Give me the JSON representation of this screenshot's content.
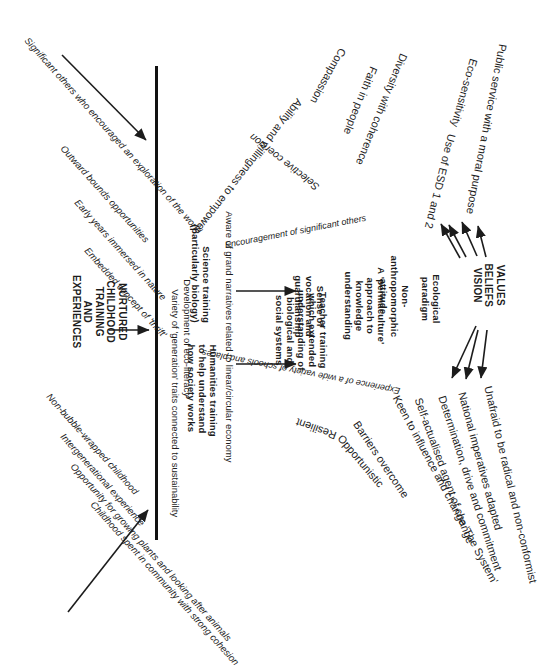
{
  "diagram": {
    "orientation": "rotated-90-clockwise",
    "ink_color": "#1c1c1c",
    "spine_color": "#111111"
  },
  "hub": {
    "line1": "VALUES",
    "line2": "BELIEFS",
    "line3": "VISION"
  },
  "root_block": {
    "line1": "NURTURED",
    "line2": "CHILDHOOD",
    "line3": "TRAINING",
    "line4": "AND",
    "line5": "EXPERIENCES"
  },
  "early_experiences": [
    "Significant others who encouraged an exploration of the world",
    "Outward bounds opportunities",
    "Early years immersed in nature",
    "Embedded concept of 'thrift'"
  ],
  "childhood_experiences": [
    "Non-bubble-wrapped childhood",
    "Intergenerational experience",
    "Opportunity for growing plants and looking after animals",
    "Childhood spent in community with strong cohesion"
  ],
  "training_column": [
    "Aware of grand narratives related to linear/circular economy",
    "Science training (particularly biology)",
    "Humanities training to help understand how society works",
    "Development of eco-literacy",
    "Variety of 'generation' traits connected to sustainability"
  ],
  "training_column_parts": {
    "grand_narratives": "Aware of grand narratives related to linear/circular economy",
    "science_l1": "Science training",
    "science_l2": "(particularly biology)",
    "humanities_l1": "Humanities training",
    "humanities_l2": "to help understand",
    "humanities_l3": "how society works",
    "eco_literacy": "Development of eco-literacy",
    "generation_traits": "Variety of 'generation' traits connected to sustainability"
  },
  "mid_column": {
    "teacher_training_l1": "Teacher training",
    "teacher_training_l2": "which extended",
    "teacher_training_l3": "understanding of",
    "teacher_training_l4": "biological and",
    "teacher_training_l5": "social systems",
    "vocation_l1": "Sense of",
    "vocation_l2": "vocation and",
    "vocation_l3": "guardianship",
    "permaculture_l1": "A 'permaculture'",
    "permaculture_l2": "approach to",
    "permaculture_l3": "knowledge",
    "permaculture_l4": "understanding",
    "non_anthro_l1": "Non-",
    "non_anthro_l2": "anthropomorphic",
    "non_anthro_l3": "attitude",
    "ecological_l1": "Ecological",
    "ecological_l2": "paradigm"
  },
  "influences": {
    "encouragement": "Encouragement of significant others",
    "experience_schools": "Experience of a wide variety of schools and places",
    "selective_coercion": "Selective coercion"
  },
  "values_fan": [
    "Public service with a moral purpose",
    "Eco-sensitivity",
    "Use of ESD 1 and 2",
    "Diversity with coherence",
    "Faith in people",
    "Compassion",
    "Ability and willingness to empower"
  ],
  "action_fan": [
    "Unafraid to be radical and non-conformist",
    "National imperatives adapted",
    "Determination, drive and commitment",
    "Self-actualised agent of change",
    "Keen to influence and change 'The System'",
    "Barriers overcome",
    "Opportunistic",
    "Resilient"
  ]
}
